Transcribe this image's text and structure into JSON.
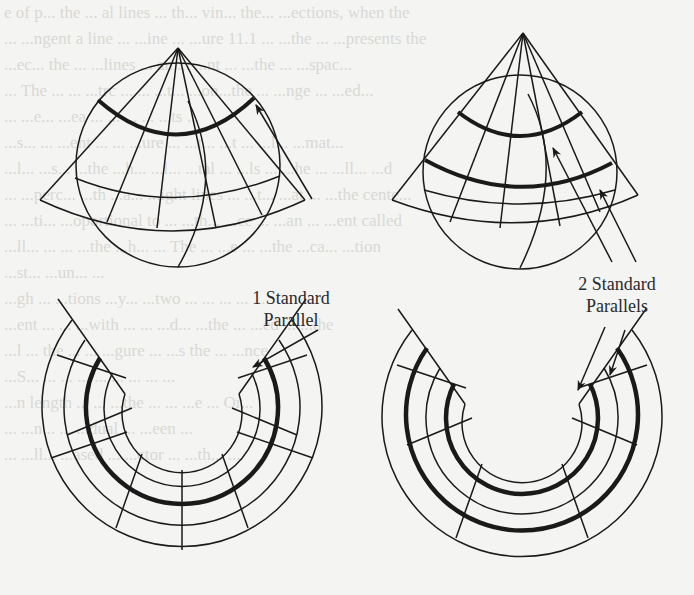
{
  "figure": {
    "panels": [
      {
        "id": "cone-one-parallel",
        "description": "Cone tangent to globe along one standard parallel"
      },
      {
        "id": "cone-two-parallels",
        "description": "Secant cone cutting globe along two standard parallels"
      },
      {
        "id": "flat-one-parallel",
        "description": "Unrolled conic projection with one standard parallel"
      },
      {
        "id": "flat-two-parallels",
        "description": "Unrolled conic projection with two standard parallels"
      }
    ],
    "labels": {
      "one_parallel_line1": "1 Standard",
      "one_parallel_line2": "Parallel",
      "two_parallels_line1": "2 Standard",
      "two_parallels_line2": "Parallels"
    }
  },
  "bleed_through_text": [
    "",
    "e of p... the ... al lines ... th... vin... the... ...ections, when the",
    "... ...ngent a line ... ...ine ... ...ure 11.1 ... ...the ... ...presents the",
    "...ec... the ... ...lines ... an ... ...nt ... ...the ... ...spac...",
    "... The ... ... ...trc ... ... ...t... ...on...the ... ...nge ... ...ed...",
    "... ...e... ...ea ... ... ... ... ...ts ...",
    "...s... ... ...ent ... ... ...ure ... ...t... ...t ... ...l... ...mat...",
    "...l... ...s... ...the ...h... ...l... ...tal ... ...ls ... ...he ... ...ll... ...d",
    "... ...perc... ...th ...a... ...ight lines ... ...t... ...at ... ...the cente...",
    "... ...ti... ...oportional to ... ...th... ...ce ... ...an ... ...ent called",
    "...ll... ... ... ...the ...h... ... The ... ...e ... ...the ...ca... ...tion",
    "...st... ...un... ...",
    "...gh ... ...tions ...y... ...two ... ... ... ... ...",
    "...ent ... ... ...with ... ... ...d... ...the ... ...ed ... ...the",
    "...l ... the ... ... ...gure ... ...s the ... ...nce",
    "...S... ... ... ... ... ... ... ... ...",
    "...n length ... ... ...the ... ... ...e ... Or...",
    "... ...n... ... ...dual ... ...een ...",
    "... ...ll... ...ased ... ...ctor ... ...th... ..."
  ]
}
